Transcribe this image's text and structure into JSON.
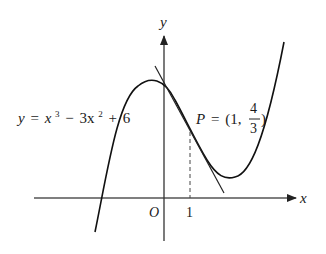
{
  "figure": {
    "function_label": {
      "lhs": "y",
      "eq": "=",
      "t1": "x",
      "e1": "3",
      "op1": "−",
      "t2": "3x",
      "e2": "2",
      "op2": "+",
      "c": "6"
    },
    "point_label": {
      "name": "P",
      "eq": "=",
      "open": "(1,",
      "num": "4",
      "den": "3",
      "close": ")"
    },
    "axes": {
      "x_label": "x",
      "y_label": "y",
      "origin_label": "O",
      "tick_1": "1"
    },
    "colors": {
      "curve": "#111111",
      "axis": "#444444",
      "text": "#1a1a1a"
    }
  }
}
